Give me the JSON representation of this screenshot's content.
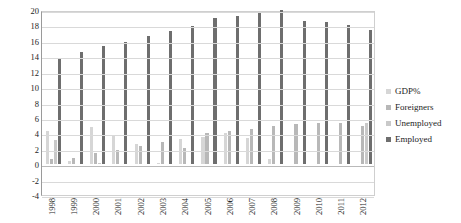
{
  "chart_data": {
    "type": "bar",
    "title": "",
    "xlabel": "",
    "ylabel": "",
    "ylim": [
      -4,
      20
    ],
    "ytick_step": 2,
    "yticks": [
      "20",
      "18",
      "16",
      "14",
      "12",
      "10",
      "8",
      "6",
      "4",
      "2",
      "0",
      "-2",
      "-4"
    ],
    "grid": true,
    "legend_position": "right",
    "categories": [
      "1998",
      "1999",
      "2000",
      "2001",
      "2002",
      "2003",
      "2004",
      "2005",
      "2006",
      "2007",
      "2008",
      "2009",
      "2010",
      "2011",
      "2012"
    ],
    "series": [
      {
        "name": "GDP%",
        "color": "#d6d6d6",
        "values": [
          4.3,
          0.4,
          4.8,
          3.7,
          2.6,
          0.2,
          3.3,
          3.5,
          4.0,
          3.4,
          0.7,
          0.0,
          0.0,
          0.0,
          0.0
        ]
      },
      {
        "name": "Foreigners",
        "color": "#b8b8b8",
        "values": [
          0.7,
          0.8,
          1.4,
          1.9,
          2.4,
          2.9,
          2.1,
          4.0,
          4.3,
          4.6,
          5.0,
          5.2,
          5.3,
          5.3,
          4.9
        ]
      },
      {
        "name": "Unemployed",
        "color": "#c9c9c9",
        "values": [
          3.1,
          0.0,
          0.1,
          0.0,
          0.0,
          0.0,
          0.0,
          0.0,
          0.0,
          0.0,
          0.0,
          0.0,
          0.0,
          0.0,
          5.3
        ]
      },
      {
        "name": "Employed",
        "color": "#6e6e6e",
        "values": [
          13.7,
          14.5,
          15.3,
          15.8,
          16.6,
          17.3,
          17.9,
          18.9,
          19.2,
          19.7,
          20.0,
          18.6,
          18.4,
          18.0,
          17.4
        ]
      }
    ]
  },
  "legend": {
    "items": [
      {
        "label": "GDP%"
      },
      {
        "label": "Foreigners"
      },
      {
        "label": "Unemployed"
      },
      {
        "label": "Employed"
      }
    ]
  }
}
